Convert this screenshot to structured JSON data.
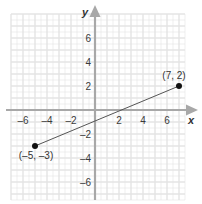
{
  "chart_data": {
    "type": "line",
    "title": "",
    "xlabel": "x",
    "ylabel": "y",
    "xlim": [
      -7,
      7.5
    ],
    "ylim": [
      -7.5,
      8
    ],
    "grid": true,
    "x_ticks": [
      -6,
      -4,
      -2,
      2,
      4,
      6
    ],
    "y_ticks": [
      6,
      4,
      2,
      -2,
      -4,
      -6
    ],
    "series": [
      {
        "name": "segment",
        "points": [
          {
            "x": -5,
            "y": -3,
            "label": "(–5, –3)"
          },
          {
            "x": 7,
            "y": 2,
            "label": "(7, 2)"
          }
        ]
      }
    ]
  },
  "labels": {
    "x_axis": "x",
    "y_axis": "y",
    "x_ticks": [
      "–6",
      "–4",
      "–2",
      "2",
      "4",
      "6"
    ],
    "y_ticks": [
      "6",
      "4",
      "2",
      "–2",
      "–4",
      "–6"
    ],
    "point_a": "(–5, –3)",
    "point_b": "(7, 2)"
  },
  "colors": {
    "grid": "#e4e4e4",
    "axis": "#a8a8a8",
    "segment": "#555555",
    "point": "#111111"
  }
}
